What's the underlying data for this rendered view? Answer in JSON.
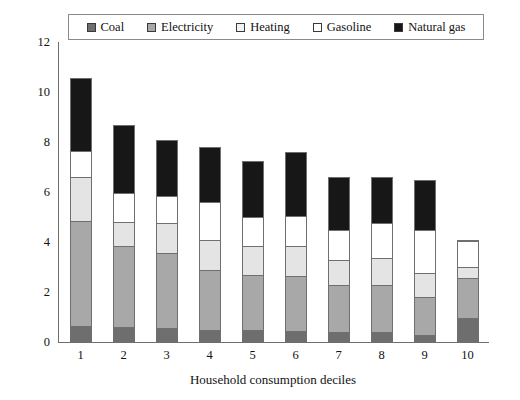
{
  "chart_data": {
    "type": "bar",
    "stacked": true,
    "title": "",
    "xlabel": "Household consumption deciles",
    "ylabel": "",
    "ylim": [
      0,
      12
    ],
    "ytick_values": [
      0,
      2,
      4,
      6,
      8,
      10,
      12
    ],
    "ytick_labels": [
      "0",
      "2",
      "4",
      "6",
      "8",
      "10",
      "12"
    ],
    "grid": false,
    "legend_position": "top",
    "categories": [
      "1",
      "2",
      "3",
      "4",
      "5",
      "6",
      "7",
      "8",
      "9",
      "10"
    ],
    "series": [
      {
        "name": "Coal",
        "color": "#6e6e6e",
        "values": [
          0.65,
          0.6,
          0.55,
          0.5,
          0.5,
          0.45,
          0.4,
          0.4,
          0.3,
          0.95
        ]
      },
      {
        "name": "Electricity",
        "color": "#a8a8a8",
        "values": [
          4.2,
          3.25,
          3.0,
          2.4,
          2.2,
          2.2,
          1.9,
          1.9,
          1.5,
          1.6
        ]
      },
      {
        "name": "Heating",
        "color": "#e4e4e4",
        "values": [
          1.75,
          0.95,
          1.2,
          1.2,
          1.15,
          1.2,
          1.0,
          1.05,
          0.95,
          0.45
        ]
      },
      {
        "name": "Gasoline",
        "color": "#ffffff",
        "values": [
          1.05,
          1.15,
          1.1,
          1.5,
          1.15,
          1.2,
          1.2,
          1.4,
          1.75,
          1.05
        ]
      },
      {
        "name": "Natural gas",
        "color": "#171717",
        "values": [
          2.9,
          2.75,
          2.25,
          2.2,
          2.25,
          2.55,
          2.1,
          1.85,
          2.0,
          0.05
        ]
      }
    ],
    "totals": [
      10.55,
      8.7,
      8.1,
      7.8,
      7.25,
      7.6,
      6.6,
      6.6,
      6.5,
      4.1
    ]
  },
  "legend": {
    "entries": [
      {
        "label": "Coal",
        "swatch_color": "#6e6e6e"
      },
      {
        "label": "Electricity",
        "swatch_color": "#a8a8a8"
      },
      {
        "label": "Heating",
        "swatch_color": "#f2f2f2"
      },
      {
        "label": "Gasoline",
        "swatch_color": "#ffffff"
      },
      {
        "label": "Natural gas",
        "swatch_color": "#171717"
      }
    ]
  }
}
